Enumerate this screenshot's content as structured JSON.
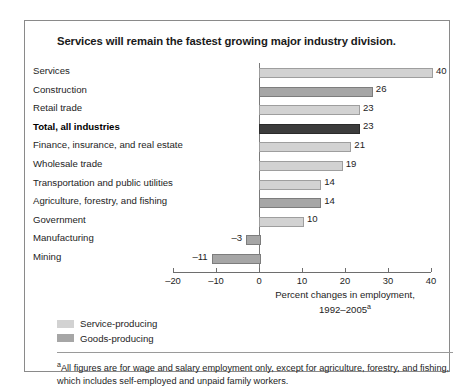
{
  "chart_data": {
    "type": "bar",
    "orientation": "horizontal",
    "title": "Services will remain the fastest growing major industry division.",
    "xlabel": "Percent changes in employment, 1992–2005a",
    "xlabel_line1": "Percent changes in employment,",
    "xlabel_line2": "1992–2005",
    "xlabel_line2_sup": "a",
    "ylabel": "",
    "xlim": [
      -20,
      40
    ],
    "grid": false,
    "legend_position": "bottom-left",
    "categories": [
      "Services",
      "Construction",
      "Retail trade",
      "Total, all industries",
      "Finance, insurance, and real estate",
      "Wholesale trade",
      "Transportation and public utilities",
      "Agriculture, forestry, and fishing",
      "Government",
      "Manufacturing",
      "Mining"
    ],
    "values": [
      40,
      26,
      23,
      23,
      21,
      19,
      14,
      14,
      10,
      -3,
      -11
    ],
    "value_labels": [
      "40",
      "26",
      "23",
      "23",
      "21",
      "19",
      "14",
      "14",
      "10",
      "–3",
      "–11"
    ],
    "series_of_bar": [
      "service",
      "goods",
      "service",
      "total",
      "service",
      "service",
      "service",
      "goods",
      "service",
      "goods",
      "goods"
    ],
    "emphasized": [
      false,
      false,
      false,
      true,
      false,
      false,
      false,
      false,
      false,
      false,
      false
    ],
    "xticks": [
      -20,
      -10,
      0,
      10,
      20,
      30,
      40
    ],
    "xtick_labels": [
      "–20",
      "–10",
      "0",
      "10",
      "20",
      "30",
      "40"
    ],
    "legend": [
      {
        "label": "Service-producing",
        "color": "#d2d2d2",
        "key": "service"
      },
      {
        "label": "Goods-producing",
        "color": "#a6a6a6",
        "key": "goods"
      }
    ],
    "colors": {
      "service_producing": "#d2d2d2",
      "goods_producing": "#a6a6a6",
      "total_all_industries": "#3c3c3c",
      "axis": "#6e6e6e",
      "text": "#1d1d1d",
      "frame": "#8a8a8a"
    },
    "footnote_marker": "a",
    "footnote": "All figures are for wage and salary employment only, except for agriculture, forestry, and fishing, which includes self-employed and unpaid family workers."
  }
}
